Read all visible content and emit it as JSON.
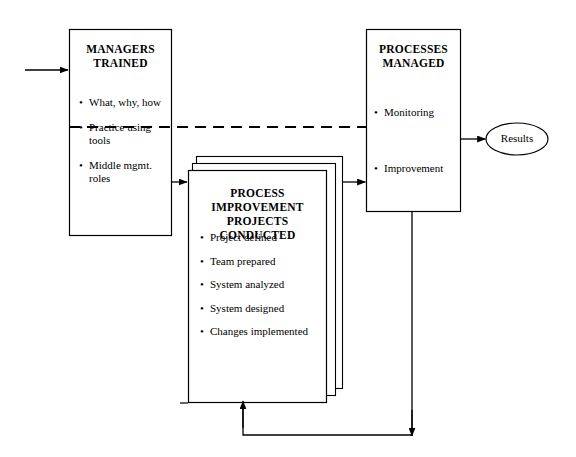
{
  "diagram": {
    "type": "flow-diagram",
    "background_color": "#ffffff",
    "stroke_color": "#000000",
    "nodes": {
      "managers": {
        "title_line1": "MANAGERS",
        "title_line2": "TRAINED",
        "bullet_marker": "•",
        "bullets": [
          "What, why, how",
          "Practice using tools",
          "Middle mgmt. roles"
        ]
      },
      "projects": {
        "title_line1": "PROCESS IMPROVEMENT",
        "title_line2": "PROJECTS CONDUCTED",
        "bullet_marker": "•",
        "bullets": [
          "Project defined",
          "Team prepared",
          "System analyzed",
          "System designed",
          "Changes implemented"
        ],
        "stack_count": 3
      },
      "processes": {
        "title_line1": "PROCESSES",
        "title_line2": "MANAGED",
        "bullet_marker": "•",
        "bullets": [
          "Monitoring",
          "Improvement"
        ]
      },
      "results": {
        "label": "Results"
      }
    },
    "connectors": [
      {
        "name": "input-to-managers",
        "style": "solid",
        "arrow": true
      },
      {
        "name": "managers-to-projects",
        "style": "solid",
        "arrow": true
      },
      {
        "name": "projects-to-processes",
        "style": "solid",
        "arrow": true
      },
      {
        "name": "processes-to-results",
        "style": "solid",
        "arrow": true
      },
      {
        "name": "managers-to-processes-dashed",
        "style": "dashed",
        "arrow": false
      },
      {
        "name": "processes-feedback-to-projects",
        "style": "solid",
        "arrow": true
      },
      {
        "name": "projects-feedback-loop",
        "style": "solid",
        "arrow": true
      }
    ]
  }
}
